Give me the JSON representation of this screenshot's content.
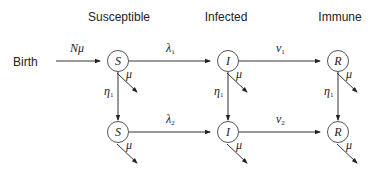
{
  "columns": {
    "susceptible": "Susceptible",
    "infected": "Infected",
    "immune": "Immune"
  },
  "birth": {
    "label": "Birth",
    "rate_main": "N",
    "rate_sym": "μ"
  },
  "nodes": {
    "s1": "S",
    "i1": "I",
    "r1": "R",
    "s2": "S",
    "i2": "I",
    "r2": "R"
  },
  "edges": {
    "lambda1": {
      "main": "λ",
      "sub": "1"
    },
    "nu1": {
      "main": "ν",
      "sub": "1"
    },
    "lambda2": {
      "main": "λ",
      "sub": "2"
    },
    "nu2": {
      "main": "ν",
      "sub": "2"
    },
    "eta_s": {
      "main": "η",
      "sub": "1"
    },
    "eta_i": {
      "main": "η",
      "sub": "1"
    },
    "eta_r": {
      "main": "η",
      "sub": "1"
    },
    "death": "μ"
  }
}
